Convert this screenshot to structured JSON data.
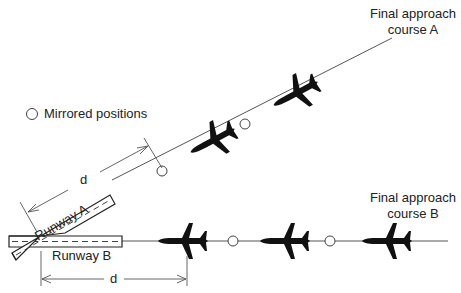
{
  "diagram": {
    "legend": {
      "symbol": "open-circle",
      "label": "Mirrored positions"
    },
    "courses": [
      {
        "id": "A",
        "label_line1": "Final approach",
        "label_line2": "course A"
      },
      {
        "id": "B",
        "label_line1": "Final approach",
        "label_line2": "course B"
      }
    ],
    "runways": [
      {
        "id": "A",
        "label": "Runway A"
      },
      {
        "id": "B",
        "label": "Runway B"
      }
    ],
    "dimensions": [
      {
        "id": "d-course-a",
        "label": "d"
      },
      {
        "id": "d-course-b",
        "label": "d"
      }
    ],
    "aircraft": {
      "course_a_count": 2,
      "course_b_count": 3
    },
    "mirrored_positions": {
      "course_a_count": 2,
      "course_b_count": 2
    },
    "colors": {
      "line": "#444444",
      "aircraft": "#111111",
      "dimension": "#555555"
    }
  }
}
